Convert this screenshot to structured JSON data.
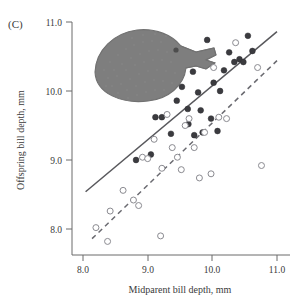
{
  "figure": {
    "panel_label": "(C)",
    "background": "#ffffff"
  },
  "axes": {
    "x_title": "Midparent bill depth, mm",
    "y_title": "Offspring bill depth, mm",
    "x_ticks": [
      "8.0",
      "9.0",
      "10.0",
      "11.0"
    ],
    "y_ticks": [
      "8.0",
      "9.0",
      "10.0",
      "11.0"
    ]
  },
  "illustration": {
    "name": "darwin-finch-head",
    "description": "stippled drawing of a ground finch head in profile facing right"
  },
  "chart_data": {
    "type": "scatter",
    "title": "",
    "xlabel": "Midparent bill depth, mm",
    "ylabel": "Offspring bill depth, mm",
    "xlim": [
      7.78,
      11.18
    ],
    "ylim": [
      7.68,
      11.05
    ],
    "x_ticks": [
      8.0,
      9.0,
      10.0,
      11.0
    ],
    "y_ticks": [
      8.0,
      9.0,
      10.0,
      11.0
    ],
    "grid": false,
    "legend": "none",
    "series": [
      {
        "name": "Filled circles",
        "marker": "filled-circle",
        "color": "#3b3b3f",
        "points": [
          [
            9.12,
            9.62
          ],
          [
            9.22,
            9.62
          ],
          [
            9.36,
            9.38
          ],
          [
            9.45,
            9.86
          ],
          [
            9.53,
            10.06
          ],
          [
            9.62,
            9.74
          ],
          [
            9.63,
            9.52
          ],
          [
            9.7,
            10.28
          ],
          [
            9.72,
            9.36
          ],
          [
            9.78,
            9.98
          ],
          [
            9.82,
            9.72
          ],
          [
            9.85,
            9.4
          ],
          [
            9.92,
            10.74
          ],
          [
            9.98,
            9.6
          ],
          [
            10.02,
            10.12
          ],
          [
            10.08,
            9.42
          ],
          [
            10.12,
            10.0
          ],
          [
            10.18,
            10.3
          ],
          [
            10.26,
            10.56
          ],
          [
            10.34,
            10.42
          ],
          [
            10.42,
            10.46
          ],
          [
            10.48,
            10.42
          ],
          [
            10.55,
            10.8
          ],
          [
            10.62,
            10.58
          ],
          [
            8.82,
            9.0
          ],
          [
            9.05,
            9.08
          ]
        ]
      },
      {
        "name": "Open circles",
        "marker": "open-circle",
        "color": "#ffffff",
        "points": [
          [
            8.2,
            8.02
          ],
          [
            8.38,
            7.82
          ],
          [
            8.42,
            8.26
          ],
          [
            8.62,
            8.56
          ],
          [
            8.78,
            8.42
          ],
          [
            8.86,
            8.34
          ],
          [
            8.92,
            9.04
          ],
          [
            9.0,
            9.02
          ],
          [
            9.1,
            9.3
          ],
          [
            9.22,
            8.88
          ],
          [
            9.3,
            9.66
          ],
          [
            9.38,
            9.18
          ],
          [
            9.46,
            9.04
          ],
          [
            9.52,
            8.86
          ],
          [
            9.58,
            9.5
          ],
          [
            9.64,
            9.6
          ],
          [
            9.72,
            9.18
          ],
          [
            9.8,
            8.74
          ],
          [
            9.88,
            9.4
          ],
          [
            10.02,
            10.34
          ],
          [
            10.1,
            9.62
          ],
          [
            10.22,
            9.6
          ],
          [
            10.36,
            10.7
          ],
          [
            10.7,
            10.34
          ],
          [
            10.76,
            8.92
          ],
          [
            9.98,
            8.8
          ],
          [
            9.2,
            7.9
          ]
        ]
      }
    ],
    "fit_lines": [
      {
        "name": "Solid regression line",
        "style": "solid",
        "color": "#58585c",
        "x_start": 8.04,
        "y_start": 8.54,
        "x_end": 11.0,
        "y_end": 10.86
      },
      {
        "name": "Dashed regression line",
        "style": "dashed",
        "color": "#6a6a70",
        "x_start": 8.14,
        "y_start": 7.86,
        "x_end": 11.0,
        "y_end": 10.44
      }
    ]
  }
}
